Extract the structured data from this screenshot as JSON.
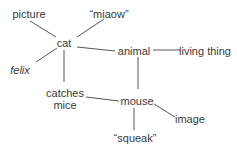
{
  "diagram": {
    "type": "semantic-network",
    "colors": {
      "text": "#3a3a3a",
      "edge": "#555555",
      "background": "#ffffff"
    },
    "nodes": [
      {
        "id": "picture",
        "label": "picture",
        "x": 29,
        "y": 14,
        "italic": false
      },
      {
        "id": "miaow",
        "label": "“miaow”",
        "x": 109,
        "y": 14,
        "italic": false
      },
      {
        "id": "cat",
        "label": "cat",
        "x": 64,
        "y": 43,
        "italic": false
      },
      {
        "id": "animal",
        "label": "animal",
        "x": 134,
        "y": 51,
        "italic": false
      },
      {
        "id": "living_thing",
        "label": "living thing",
        "x": 205,
        "y": 51,
        "italic": false
      },
      {
        "id": "felix",
        "label": "felix",
        "x": 20,
        "y": 70,
        "italic": true
      },
      {
        "id": "catches_mice",
        "label": "catches\nmice",
        "x": 65,
        "y": 99,
        "italic": false
      },
      {
        "id": "mouse",
        "label": "mouse",
        "x": 137,
        "y": 101,
        "italic": false
      },
      {
        "id": "image",
        "label": "image",
        "x": 190,
        "y": 119,
        "italic": false
      },
      {
        "id": "squeak",
        "label": "“squeak”",
        "x": 135,
        "y": 138,
        "italic": false
      }
    ],
    "edges": [
      {
        "from": "picture",
        "to": "cat",
        "x1": 30,
        "y1": 21,
        "x2": 56,
        "y2": 37
      },
      {
        "from": "miaow",
        "to": "cat",
        "x1": 104,
        "y1": 19,
        "x2": 77,
        "y2": 37
      },
      {
        "from": "cat",
        "to": "animal",
        "x1": 77,
        "y1": 47,
        "x2": 115,
        "y2": 51
      },
      {
        "from": "cat",
        "to": "felix",
        "x1": 57,
        "y1": 48,
        "x2": 36,
        "y2": 62
      },
      {
        "from": "cat",
        "to": "catches_mice",
        "x1": 64,
        "y1": 50,
        "x2": 64,
        "y2": 82
      },
      {
        "from": "animal",
        "to": "living_thing",
        "x1": 153,
        "y1": 50,
        "x2": 180,
        "y2": 50
      },
      {
        "from": "animal",
        "to": "mouse",
        "x1": 138,
        "y1": 57,
        "x2": 138,
        "y2": 89
      },
      {
        "from": "catches_mice",
        "to": "mouse",
        "x1": 86,
        "y1": 97,
        "x2": 119,
        "y2": 101
      },
      {
        "from": "mouse",
        "to": "image",
        "x1": 154,
        "y1": 104,
        "x2": 175,
        "y2": 117
      },
      {
        "from": "mouse",
        "to": "squeak",
        "x1": 134,
        "y1": 108,
        "x2": 134,
        "y2": 130
      }
    ]
  }
}
